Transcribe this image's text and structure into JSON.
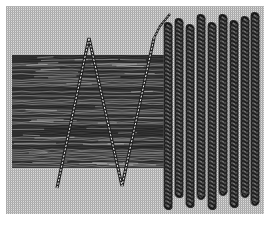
{
  "figure": {
    "subject": "Embroidery stitch illustration: laid threads couched with zigzag stitch beside vertical chain-stitch columns",
    "width": 270,
    "height": 226,
    "colors": {
      "paper": "#ffffff",
      "grid_light": "#d8d8d8",
      "grid_dark": "#9a9a9a",
      "thread_band": "#3a3a3a",
      "thread_highlight": "#e6e6e6",
      "stitch": "#1e1e1e"
    },
    "background_grid": {
      "x": 6,
      "y": 6,
      "width": 258,
      "height": 208,
      "pitch": 2
    },
    "laid_thread_band": {
      "x": 12,
      "y": 55,
      "width": 160,
      "height": 113
    },
    "zigzag_stitch": {
      "points": [
        [
          57,
          188
        ],
        [
          89,
          38
        ],
        [
          122,
          186
        ],
        [
          154,
          38
        ]
      ],
      "tail": [
        [
          154,
          38
        ],
        [
          160,
          26
        ],
        [
          170,
          14
        ]
      ]
    },
    "chain_columns": {
      "count": 9,
      "x": [
        168,
        179,
        190,
        201,
        212,
        223,
        234,
        245,
        255
      ],
      "top_y": [
        22,
        18,
        24,
        14,
        22,
        14,
        20,
        16,
        12
      ],
      "bottom_y": [
        210,
        198,
        208,
        200,
        210,
        196,
        208,
        198,
        206
      ]
    }
  }
}
